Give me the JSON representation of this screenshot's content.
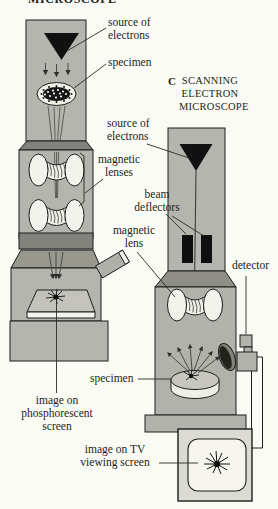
{
  "figure": {
    "top_title_partial": "MICROSCOPE",
    "panel_c": {
      "letter": "C",
      "title": "SCANNING\nELECTRON\nMICROSCOPE"
    }
  },
  "labels": {
    "tem_source": "source of\nelectrons",
    "tem_specimen": "specimen",
    "magnetic_lenses": "magnetic\nlenses",
    "sem_source": "source of\nelectrons",
    "beam_deflectors": "beam\ndeflectors",
    "magnetic_lens": "magnetic\nlens",
    "detector": "detector",
    "tem_screen": "image on\nphosphorescent\nscreen",
    "sem_specimen": "specimen",
    "tv_screen": "image on TV\nviewing screen"
  },
  "colors": {
    "paper": "#fbfbf5",
    "body_gray": "#b5b5af",
    "chamber_gray": "#b2b2ac",
    "dark_gray": "#82827c",
    "shadow_gray": "#98988f",
    "tv_gray": "#dbdbd4",
    "screen_white": "#f6f6ef",
    "ink": "#1c1c1c"
  }
}
